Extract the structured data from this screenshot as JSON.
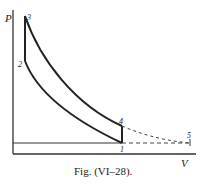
{
  "diagram": {
    "type": "pv-diagram",
    "axes": {
      "y_label": "P",
      "x_label": "V"
    },
    "points": [
      {
        "id": "1",
        "label": "1"
      },
      {
        "id": "2",
        "label": "2"
      },
      {
        "id": "3",
        "label": "3"
      },
      {
        "id": "4",
        "label": "4"
      },
      {
        "id": "5",
        "label": "5"
      }
    ],
    "caption": "Fig. (VI–28)."
  }
}
